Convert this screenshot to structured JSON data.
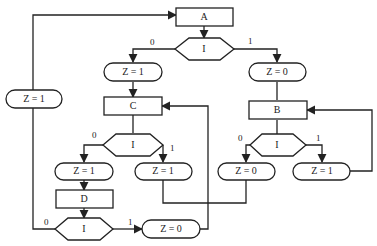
{
  "diagram": {
    "type": "flowchart",
    "nodes": {
      "A": {
        "kind": "process",
        "label": "A"
      },
      "dec_top": {
        "kind": "decision",
        "label": "I"
      },
      "z_top_l": {
        "kind": "terminal",
        "label": "Z = 1"
      },
      "z_top_r": {
        "kind": "terminal",
        "label": "Z = 0"
      },
      "C": {
        "kind": "process",
        "label": "C"
      },
      "B": {
        "kind": "process",
        "label": "B"
      },
      "dec_c": {
        "kind": "decision",
        "label": "I"
      },
      "z_c_l": {
        "kind": "terminal",
        "label": "Z = 1"
      },
      "z_c_r": {
        "kind": "terminal",
        "label": "Z = 1"
      },
      "dec_b": {
        "kind": "decision",
        "label": "I"
      },
      "z_b_l": {
        "kind": "terminal",
        "label": "Z = 0"
      },
      "z_b_r": {
        "kind": "terminal",
        "label": "Z = 1"
      },
      "D": {
        "kind": "process",
        "label": "D"
      },
      "dec_d": {
        "kind": "decision",
        "label": "I"
      },
      "z_d_r": {
        "kind": "terminal",
        "label": "Z = 0"
      },
      "z_loop": {
        "kind": "terminal",
        "label": "Z = 1"
      }
    },
    "edge_labels": {
      "top_0": "0",
      "top_1": "1",
      "c_0": "0",
      "c_1": "1",
      "b_0": "0",
      "b_1": "1",
      "d_0": "0",
      "d_1": "1"
    },
    "edges": [
      {
        "from": "A",
        "to": "dec_top"
      },
      {
        "from": "dec_top",
        "to": "z_top_l",
        "label": "0"
      },
      {
        "from": "dec_top",
        "to": "z_top_r",
        "label": "1"
      },
      {
        "from": "z_top_l",
        "to": "C"
      },
      {
        "from": "z_top_r",
        "to": "B"
      },
      {
        "from": "C",
        "to": "dec_c"
      },
      {
        "from": "dec_c",
        "to": "z_c_l",
        "label": "0"
      },
      {
        "from": "dec_c",
        "to": "z_c_r",
        "label": "1"
      },
      {
        "from": "z_c_l",
        "to": "D"
      },
      {
        "from": "D",
        "to": "dec_d"
      },
      {
        "from": "dec_d",
        "to": "z_loop",
        "label": "0"
      },
      {
        "from": "z_loop",
        "to": "A"
      },
      {
        "from": "dec_d",
        "to": "z_d_r",
        "label": "1"
      },
      {
        "from": "z_d_r",
        "to": "C"
      },
      {
        "from": "B",
        "to": "dec_b"
      },
      {
        "from": "dec_b",
        "to": "z_b_l",
        "label": "0"
      },
      {
        "from": "dec_b",
        "to": "z_b_r",
        "label": "1"
      },
      {
        "from": "z_b_r",
        "to": "B"
      },
      {
        "from": "z_c_r",
        "to": "z_b_l"
      }
    ]
  }
}
